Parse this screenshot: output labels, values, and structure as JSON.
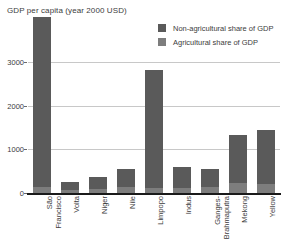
{
  "chart_data": {
    "type": "bar",
    "title": "GDP per capita (year 2000 USD)",
    "xlabel": "",
    "ylabel": "",
    "ylim": [
      0,
      3300
    ],
    "grid": true,
    "legend_position": "top-right",
    "yticks": [
      0,
      1000,
      2000,
      3000
    ],
    "ytick_labels": [
      "0",
      "1000",
      "2000",
      "3000"
    ],
    "categories": [
      "São Francisco",
      "Volta",
      "Niger",
      "Nile",
      "Limpopo",
      "Indus",
      "Ganges-Brahmaputra",
      "Mekong",
      "Yellow"
    ],
    "category_lines": [
      [
        "São",
        "Francisco"
      ],
      [
        "Volta"
      ],
      [
        "Niger"
      ],
      [
        "Nile"
      ],
      [
        "Limpopo"
      ],
      [
        "Indus"
      ],
      [
        "Ganges-",
        "Brahmaputra"
      ],
      [
        "Mekong"
      ],
      [
        "Yellow"
      ]
    ],
    "stacked": true,
    "series": [
      {
        "name": "Non-agricultural share of GDP",
        "color": "#5a5a5a",
        "values": [
          3900,
          170,
          270,
          430,
          2690,
          470,
          420,
          1110,
          1230
        ]
      },
      {
        "name": "Agricultural share of GDP",
        "color": "#7d7d7d",
        "values": [
          130,
          80,
          100,
          130,
          125,
          125,
          130,
          220,
          210
        ]
      }
    ],
    "totals": [
      4030,
      250,
      370,
      560,
      2815,
      595,
      550,
      1330,
      1440
    ],
    "note_clipped": "São Francisco bar exceeds the plotted axis range and is clipped at the top"
  },
  "legend": {
    "items": [
      {
        "label": "Non-agricultural share of GDP",
        "color": "#5a5a5a"
      },
      {
        "label": "Agricultural share of GDP",
        "color": "#7d7d7d"
      }
    ]
  },
  "colors": {
    "non_agricultural": "#5a5a5a",
    "agricultural": "#7d7d7d",
    "gridline": "#c8c8c8",
    "axis": "#1a1a1a",
    "text": "#3c3c3c",
    "background": "#ffffff"
  }
}
